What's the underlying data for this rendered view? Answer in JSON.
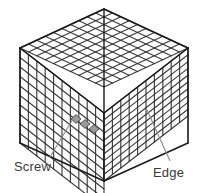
{
  "figure": {
    "background_color": "#ffffff",
    "width": 204,
    "height": 193
  },
  "geometry": {
    "description": "Isometric cube drawn as a wireframe lattice grid",
    "divisions_per_edge": 10,
    "top_apex": {
      "x": 104,
      "y": 9
    },
    "left_corner": {
      "x": 20,
      "y": 48
    },
    "right_corner": {
      "x": 188,
      "y": 48
    },
    "front_corner": {
      "x": 104,
      "y": 113
    },
    "bottom_front": {
      "x": 104,
      "y": 181
    },
    "bottom_left": {
      "x": 20,
      "y": 143
    },
    "bottom_right": {
      "x": 188,
      "y": 143
    }
  },
  "style": {
    "grid_line_color": "#2b2b2b",
    "outline_color": "#1a1a1a",
    "highlight_fill": "#9a9a9a",
    "highlight_stroke": "#3d3d3d",
    "leader_line_color": "#8a8a8a",
    "label_color": "#3a3a3a",
    "face_top_fill": "#ffffff",
    "face_left_fill": "#ffffff",
    "face_right_fill": "#ffffff"
  },
  "callouts": [
    {
      "id": "screw",
      "label": "Screw",
      "label_x": 14,
      "label_y": 171,
      "leader_from": {
        "x": 50,
        "y": 157
      },
      "leader_to": {
        "x": 73,
        "y": 119
      },
      "target": "grey-highlighted-cells-on-front-left-face"
    },
    {
      "id": "edge",
      "label": "Edge",
      "label_x": 153,
      "label_y": 177,
      "leader_from": {
        "x": 170,
        "y": 161
      },
      "leader_to": {
        "x": 147,
        "y": 110
      },
      "target": "right-face-lattice-edge"
    }
  ],
  "highlight_cells": {
    "name": "screw-highlight",
    "count": 3,
    "fill": "#9a9a9a",
    "cells": [
      {
        "x": 76,
        "y": 119
      },
      {
        "x": 85,
        "y": 124
      },
      {
        "x": 94,
        "y": 129
      }
    ]
  }
}
